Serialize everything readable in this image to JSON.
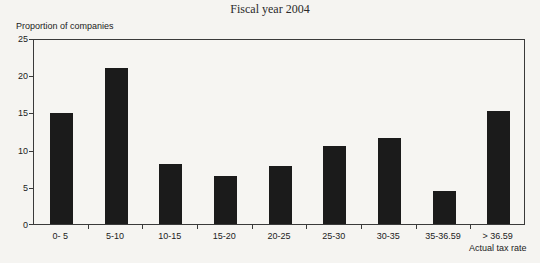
{
  "chart_data": {
    "type": "bar",
    "title": "Fiscal year 2004",
    "ylabel": "Proportion of companies",
    "xlabel": "Actual tax rate",
    "categories": [
      "0- 5",
      "5-10",
      "10-15",
      "15-20",
      "20-25",
      "25-30",
      "30-35",
      "35-36.59",
      "> 36.59"
    ],
    "values": [
      14.9,
      21,
      8,
      6.4,
      7.8,
      10.5,
      11.5,
      4.5,
      15.2
    ],
    "ylim": [
      0,
      25
    ],
    "yticks": [
      0,
      5,
      10,
      15,
      20,
      25
    ],
    "grid": false,
    "legend": null,
    "bar_color": "#1b1b1b",
    "axis_color": "#3a3a3a",
    "background_color": "#f5f4f1"
  }
}
